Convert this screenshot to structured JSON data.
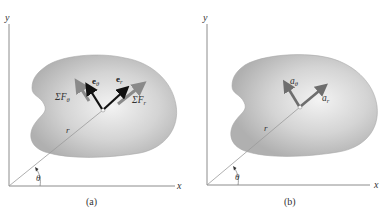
{
  "panels": [
    {
      "caption": "(a)",
      "axes": {
        "x_label": "x",
        "y_label": "y"
      },
      "position_vector_label": "r",
      "angle_label": "θ",
      "unit_vectors": [
        {
          "symbol": "e",
          "subscript": "θ",
          "color": "#111111"
        },
        {
          "symbol": "e",
          "subscript": "r",
          "color": "#111111"
        }
      ],
      "force_vectors": [
        {
          "symbol": "ΣF",
          "subscript": "θ",
          "color": "#8a8a8a"
        },
        {
          "symbol": "ΣF",
          "subscript": "r",
          "color": "#8a8a8a"
        }
      ]
    },
    {
      "caption": "(b)",
      "axes": {
        "x_label": "x",
        "y_label": "y"
      },
      "position_vector_label": "r",
      "angle_label": "θ",
      "acceleration_vectors": [
        {
          "symbol": "a",
          "subscript": "θ",
          "color": "#6e6e6e"
        },
        {
          "symbol": "a",
          "subscript": "r",
          "color": "#6e6e6e"
        }
      ]
    }
  ],
  "colors": {
    "body_fill_light": "#eeeeee",
    "body_fill_dark": "#b5b5b5",
    "axis": "#8c8c8c",
    "text": "#333333"
  }
}
